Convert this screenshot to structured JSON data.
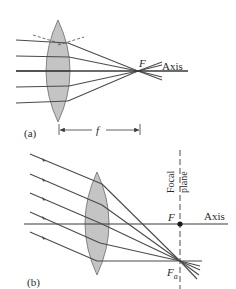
{
  "figure": {
    "panel_a": {
      "label": "(a)",
      "focal_point_label": "F",
      "axis_label": "Axis",
      "focal_length_label": "f"
    },
    "panel_b": {
      "label": "(b)",
      "focal_point_label": "F",
      "off_axis_focal_label_main": "F",
      "off_axis_focal_label_sub": "a",
      "axis_label": "Axis",
      "focal_plane_label_line1": "Focal",
      "focal_plane_label_line2": "plane"
    },
    "colors": {
      "lens_fill": "#c4c4c4",
      "lens_stroke": "#6a6a6a",
      "ray": "#4a4a4a",
      "text": "#2a2a2a"
    }
  }
}
